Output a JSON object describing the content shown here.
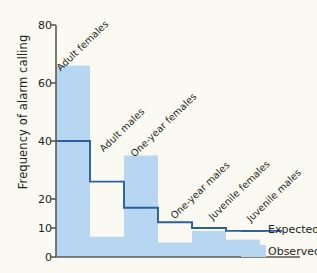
{
  "chart_data": {
    "type": "bar",
    "title": "",
    "xlabel": "",
    "ylabel": "Frequency of alarm calling",
    "ylim": [
      0,
      80
    ],
    "yticks": [
      0,
      10,
      20,
      40,
      60,
      80
    ],
    "ytick_labels": [
      "0",
      "10",
      "20",
      "40",
      "60",
      "80"
    ],
    "grid": false,
    "categories": [
      "Adult females",
      "Adult males",
      "One-year females",
      "One-year males",
      "Juvenile females",
      "Juvenile males"
    ],
    "series": [
      {
        "name": "Observed",
        "render": "bar",
        "color": "#b6d6f2",
        "values": [
          66,
          7,
          35,
          5,
          9,
          6
        ]
      },
      {
        "name": "Expected",
        "render": "step-line",
        "color": "#2c5f9e",
        "values": [
          40,
          26,
          17,
          12,
          10,
          9
        ]
      }
    ],
    "legend": {
      "position": "right-bottom",
      "entries": [
        {
          "label": "Expected",
          "marker": "line",
          "color": "#2c5f9e"
        },
        {
          "label": "Observed",
          "marker": "swatch",
          "color": "#b6d6f2"
        }
      ]
    },
    "axis_color": "#5a5a52",
    "background": "#fbfaf2"
  }
}
